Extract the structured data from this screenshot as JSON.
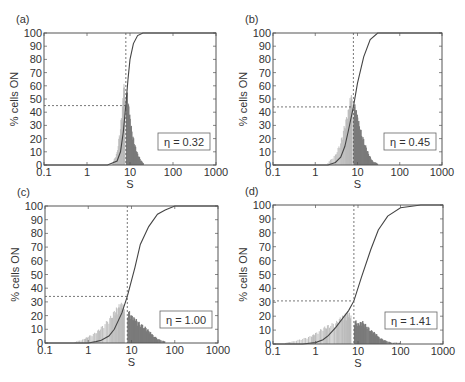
{
  "figure": {
    "panels": [
      {
        "label": "(a)",
        "eta_text": "η = 0.32",
        "xlabel": "S",
        "ylabel": "% cells ON"
      },
      {
        "label": "(b)",
        "eta_text": "η = 0.45",
        "xlabel": "S",
        "ylabel": "% cells ON"
      },
      {
        "label": "(c)",
        "eta_text": "η = 1.00",
        "xlabel": "S",
        "ylabel": "% cells ON"
      },
      {
        "label": "(d)",
        "eta_text": "η = 1.41",
        "xlabel": "S",
        "ylabel": "% cells ON"
      }
    ],
    "xticks": [
      "0.1",
      "1",
      "10",
      "100",
      "1000"
    ],
    "yticks": [
      "0",
      "10",
      "20",
      "30",
      "40",
      "50",
      "60",
      "70",
      "80",
      "90",
      "100"
    ],
    "colors": {
      "cumulative": "#444444",
      "hist_off": "#b8b8b8",
      "hist_on": "#7a7a7a",
      "axis": "#555555",
      "dashed": "#555555"
    }
  },
  "chart_data": [
    {
      "type": "line",
      "title": "(a)",
      "xlabel": "S",
      "ylabel": "% cells ON",
      "xscale": "log",
      "xlim": [
        0.1,
        1000
      ],
      "ylim": [
        0,
        100
      ],
      "annotation": "η = 0.32",
      "threshold_S": 8,
      "threshold_percent": 45,
      "series": [
        {
          "name": "cumulative % cells ON",
          "x": [
            0.1,
            3,
            5,
            6,
            7,
            8,
            9,
            10,
            12,
            15,
            20,
            1000
          ],
          "y": [
            0,
            0,
            3,
            10,
            25,
            45,
            65,
            80,
            92,
            98,
            100,
            100
          ]
        },
        {
          "name": "histogram OFF (S < threshold)",
          "x": [
            4,
            5,
            6,
            7,
            7.5
          ],
          "y": [
            2,
            10,
            30,
            55,
            70
          ]
        },
        {
          "name": "histogram ON (S ≥ threshold)",
          "x": [
            8,
            9,
            10,
            12,
            14,
            17,
            20
          ],
          "y": [
            60,
            45,
            32,
            18,
            10,
            4,
            1
          ]
        }
      ]
    },
    {
      "type": "line",
      "title": "(b)",
      "xlabel": "S",
      "ylabel": "% cells ON",
      "xscale": "log",
      "xlim": [
        0.1,
        1000
      ],
      "ylim": [
        0,
        100
      ],
      "annotation": "η = 0.45",
      "threshold_S": 8,
      "threshold_percent": 44,
      "series": [
        {
          "name": "cumulative % cells ON",
          "x": [
            0.1,
            2,
            3,
            4,
            5,
            6,
            8,
            10,
            14,
            20,
            30,
            1000
          ],
          "y": [
            0,
            0,
            2,
            6,
            14,
            25,
            44,
            62,
            82,
            95,
            100,
            100
          ]
        },
        {
          "name": "histogram OFF (S < threshold)",
          "x": [
            2,
            3,
            4,
            5,
            6,
            7,
            7.5
          ],
          "y": [
            2,
            8,
            18,
            32,
            42,
            55,
            50
          ]
        },
        {
          "name": "histogram ON (S ≥ threshold)",
          "x": [
            8,
            9,
            10,
            12,
            15,
            18,
            22,
            30
          ],
          "y": [
            48,
            42,
            35,
            25,
            15,
            8,
            3,
            1
          ]
        }
      ]
    },
    {
      "type": "line",
      "title": "(c)",
      "xlabel": "S",
      "ylabel": "% cells ON",
      "xscale": "log",
      "xlim": [
        0.1,
        1000
      ],
      "ylim": [
        0,
        100
      ],
      "annotation": "η = 1.00",
      "threshold_S": 8,
      "threshold_percent": 34,
      "series": [
        {
          "name": "cumulative % cells ON",
          "x": [
            0.1,
            1,
            1.5,
            2,
            3,
            4,
            6,
            8,
            12,
            16,
            25,
            40,
            60,
            100,
            1000
          ],
          "y": [
            0,
            0,
            1,
            2,
            5,
            10,
            22,
            34,
            55,
            72,
            85,
            94,
            97,
            100,
            100
          ]
        },
        {
          "name": "histogram OFF (S < threshold)",
          "x": [
            0.5,
            0.8,
            1,
            1.5,
            2,
            3,
            4,
            5,
            6,
            7
          ],
          "y": [
            1,
            3,
            5,
            8,
            12,
            18,
            24,
            28,
            30,
            27
          ]
        },
        {
          "name": "histogram ON (S ≥ threshold)",
          "x": [
            8,
            10,
            12,
            15,
            20,
            25,
            30,
            40,
            60
          ],
          "y": [
            25,
            20,
            18,
            15,
            12,
            9,
            6,
            3,
            1
          ]
        }
      ]
    },
    {
      "type": "line",
      "title": "(d)",
      "xlabel": "S",
      "ylabel": "% cells ON",
      "xscale": "log",
      "xlim": [
        0.1,
        1000
      ],
      "ylim": [
        0,
        100
      ],
      "annotation": "η = 1.41",
      "threshold_S": 8,
      "threshold_percent": 31,
      "series": [
        {
          "name": "cumulative % cells ON",
          "x": [
            0.1,
            0.5,
            1,
            1.5,
            2,
            3,
            4,
            6,
            8,
            12,
            20,
            30,
            50,
            100,
            300,
            1000
          ],
          "y": [
            0,
            0,
            1,
            3,
            6,
            12,
            17,
            24,
            31,
            48,
            68,
            82,
            92,
            98,
            100,
            100
          ]
        },
        {
          "name": "histogram OFF (S < threshold)",
          "x": [
            0.2,
            0.3,
            0.5,
            0.8,
            1,
            1.5,
            2,
            3,
            4,
            5,
            6,
            7
          ],
          "y": [
            1,
            2,
            4,
            6,
            8,
            12,
            14,
            16,
            20,
            22,
            24,
            20
          ]
        },
        {
          "name": "histogram ON (S ≥ threshold)",
          "x": [
            8,
            10,
            12,
            15,
            20,
            25,
            30,
            40,
            60,
            100
          ],
          "y": [
            18,
            15,
            17,
            14,
            10,
            8,
            5,
            3,
            1,
            1
          ]
        }
      ]
    }
  ]
}
